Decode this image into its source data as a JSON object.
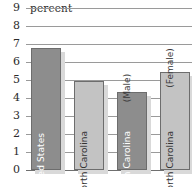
{
  "chart_data": {
    "type": "bar",
    "title": "",
    "xlabel": "",
    "ylabel": "percent",
    "ylim": [
      0,
      9
    ],
    "ytick_labels": [
      "9",
      "8",
      "7",
      "6",
      "5",
      "4",
      "3",
      "2",
      "1",
      "0"
    ],
    "ytick_values": [
      9,
      8,
      7,
      6,
      5,
      4,
      3,
      2,
      1,
      0
    ],
    "grid": true,
    "legend": "none",
    "categories": [
      "United States",
      "North Carolina",
      "North Carolina (Male)",
      "North Carolina (Female)"
    ],
    "values": [
      6.8,
      4.95,
      4.35,
      5.45
    ],
    "bars": [
      {
        "label": "United States",
        "sublabel": "",
        "value": 6.8,
        "shade": "dark",
        "label_color": "on-dark"
      },
      {
        "label": "North Carolina",
        "sublabel": "",
        "value": 4.95,
        "shade": "light",
        "label_color": "on-light"
      },
      {
        "label": "North Carolina",
        "sublabel": "(Male)",
        "value": 4.35,
        "shade": "dark",
        "label_color": "on-dark"
      },
      {
        "label": "North Carolina",
        "sublabel": "(Female)",
        "value": 5.45,
        "shade": "light",
        "label_color": "on-light"
      }
    ],
    "colors": {
      "bar_dark": "#8d8d8d",
      "bar_light": "#c3c3c3",
      "bar_border": "#6d6d6d",
      "bar_shadow": "#d9d9d9",
      "gridline": "#9a9a9a",
      "baseline": "#6f6f6f",
      "text": "#2b2b2b",
      "background": "#ffffff"
    }
  }
}
